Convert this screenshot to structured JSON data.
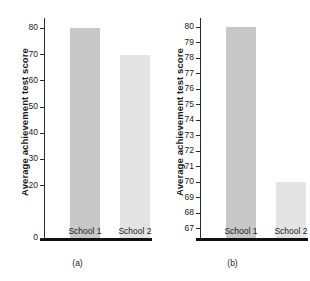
{
  "figure": {
    "background": "#ffffff",
    "axis_color": "#2b2b2b",
    "baseline_color": "#111111"
  },
  "chart_data": [
    {
      "type": "bar",
      "panel_label": "(a)",
      "title": "",
      "xlabel": "",
      "ylabel": "Average achievement test score",
      "categories": [
        "School 1",
        "School 2"
      ],
      "values": [
        80,
        70
      ],
      "bar_colors": [
        "#c8c8c8",
        "#e4e4e4"
      ],
      "ylim": [
        0,
        84
      ],
      "yticks": [
        0,
        20,
        30,
        40,
        50,
        60,
        70,
        80
      ],
      "ytick_labels": [
        "0",
        "20",
        "30",
        "40",
        "50",
        "60",
        "70",
        "80"
      ],
      "grid": false,
      "legend": "none"
    },
    {
      "type": "bar",
      "panel_label": "(b)",
      "title": "",
      "xlabel": "",
      "ylabel": "Average achievement test score",
      "categories": [
        "School 1",
        "School 2"
      ],
      "values": [
        80,
        70
      ],
      "bar_colors": [
        "#c8c8c8",
        "#e4e4e4"
      ],
      "ylim": [
        66.4,
        80.6
      ],
      "yticks": [
        67,
        68,
        69,
        70,
        71,
        72,
        73,
        74,
        75,
        76,
        77,
        78,
        79,
        80
      ],
      "ytick_labels": [
        "67",
        "68",
        "69",
        "70",
        "71",
        "72",
        "73",
        "74",
        "75",
        "76",
        "77",
        "78",
        "79",
        "80"
      ],
      "grid": false,
      "legend": "none"
    }
  ]
}
